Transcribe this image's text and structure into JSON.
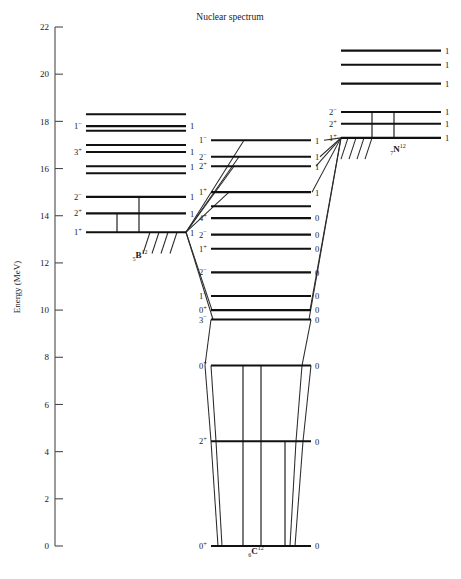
{
  "title": "Nuclear spectrum",
  "axis": {
    "label": "Energy  (MeV)",
    "unit": "MeV",
    "min": 0,
    "max": 22,
    "tick_step": 2,
    "ticks": [
      0,
      2,
      4,
      6,
      8,
      10,
      12,
      14,
      16,
      18,
      20,
      22
    ]
  },
  "caption": "",
  "colors": {
    "level_line": "#111111",
    "axis": "#4a4a4a",
    "transition": "#2b2b2b",
    "background": "#ffffff",
    "text": "#1a1a1a"
  },
  "chart_data": {
    "type": "level-diagram",
    "title": "Nuclear spectrum",
    "xlabel": "",
    "ylabel": "Energy  (MeV)",
    "ylim": [
      0,
      22
    ],
    "grid": false,
    "legend": "none",
    "annotations": [
      "Isospin T values printed at right end of each level line",
      "Spin-parity J^pi printed at left end of each labelled level line",
      "Sloping lines connect B-12 and N-12 states to analogue C-12 states"
    ],
    "nuclei": [
      {
        "name": "B12",
        "symbol": "B",
        "mass_number": "12",
        "atomic_number": "5",
        "label_display": "₅B¹²",
        "column_x": 0.25,
        "levels": [
          {
            "energy": 18.3,
            "spin_parity": "",
            "isospin": "",
            "labelled": false
          },
          {
            "energy": 17.8,
            "spin_parity": "1−",
            "isospin": "1",
            "labelled": true
          },
          {
            "energy": 17.6,
            "spin_parity": "",
            "isospin": "",
            "labelled": false
          },
          {
            "energy": 17.0,
            "spin_parity": "",
            "isospin": "",
            "labelled": false
          },
          {
            "energy": 16.7,
            "spin_parity": "3+",
            "isospin": "1",
            "labelled": true
          },
          {
            "energy": 16.1,
            "spin_parity": "",
            "isospin": "1",
            "labelled": false
          },
          {
            "energy": 15.8,
            "spin_parity": "",
            "isospin": "",
            "labelled": false
          },
          {
            "energy": 14.8,
            "spin_parity": "2−",
            "isospin": "1",
            "labelled": true
          },
          {
            "energy": 14.1,
            "spin_parity": "2+",
            "isospin": "1",
            "labelled": true
          },
          {
            "energy": 13.3,
            "spin_parity": "1+",
            "isospin": "1",
            "labelled": true
          }
        ]
      },
      {
        "name": "C12",
        "symbol": "C",
        "mass_number": "12",
        "atomic_number": "6",
        "label_display": "₆C¹²",
        "column_x": 0.55,
        "levels": [
          {
            "energy": 17.2,
            "spin_parity": "1−",
            "isospin": "1",
            "labelled": true
          },
          {
            "energy": 16.5,
            "spin_parity": "2−",
            "isospin": "1",
            "labelled": true
          },
          {
            "energy": 16.1,
            "spin_parity": "2+",
            "isospin": "1",
            "labelled": true
          },
          {
            "energy": 15.0,
            "spin_parity": "1+",
            "isospin": "1",
            "labelled": true
          },
          {
            "energy": 14.4,
            "spin_parity": "",
            "isospin": "",
            "labelled": false
          },
          {
            "energy": 13.9,
            "spin_parity": "4+",
            "isospin": "0",
            "labelled": true
          },
          {
            "energy": 13.2,
            "spin_parity": "2−",
            "isospin": "0",
            "labelled": true
          },
          {
            "energy": 12.6,
            "spin_parity": "1+",
            "isospin": "0",
            "labelled": true
          },
          {
            "energy": 11.6,
            "spin_parity": "2−",
            "isospin": "0",
            "labelled": true
          },
          {
            "energy": 10.6,
            "spin_parity": "1−",
            "isospin": "0",
            "labelled": true
          },
          {
            "energy": 10.0,
            "spin_parity": "0+",
            "isospin": "0",
            "labelled": true
          },
          {
            "energy": 9.6,
            "spin_parity": "3−",
            "isospin": "0",
            "labelled": true
          },
          {
            "energy": 7.65,
            "spin_parity": "0+",
            "isospin": "0",
            "labelled": true
          },
          {
            "energy": 4.44,
            "spin_parity": "2+",
            "isospin": "0",
            "labelled": true
          },
          {
            "energy": 0.0,
            "spin_parity": "0+",
            "isospin": "0",
            "labelled": true
          }
        ]
      },
      {
        "name": "N12",
        "symbol": "N",
        "mass_number": "12",
        "atomic_number": "7",
        "label_display": "₇N¹²",
        "column_x": 0.85,
        "levels": [
          {
            "energy": 21.0,
            "spin_parity": "",
            "isospin": "1",
            "labelled": false
          },
          {
            "energy": 20.4,
            "spin_parity": "",
            "isospin": "1",
            "labelled": false
          },
          {
            "energy": 19.6,
            "spin_parity": "",
            "isospin": "1",
            "labelled": false
          },
          {
            "energy": 18.4,
            "spin_parity": "2−",
            "isospin": "1",
            "labelled": true
          },
          {
            "energy": 17.9,
            "spin_parity": "2+",
            "isospin": "1",
            "labelled": true
          },
          {
            "energy": 17.3,
            "spin_parity": "1+",
            "isospin": "1",
            "labelled": true
          }
        ]
      }
    ]
  }
}
